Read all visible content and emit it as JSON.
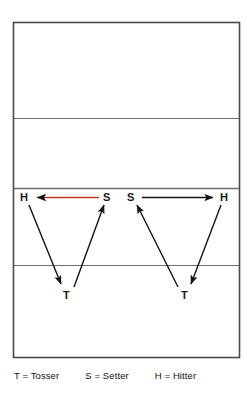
{
  "diagram": {
    "kind": "volleyball-court-drill",
    "colors": {
      "court_line": "#4a4a4a",
      "court_fill": "#ffffff",
      "arrow_black": "#141414",
      "arrow_red": "#c0392b",
      "text": "#1a1a1a"
    },
    "court": {
      "outline": {
        "x": 13,
        "y": 22,
        "width": 227,
        "height": 336
      },
      "lines": [
        {
          "name": "back-attack-line",
          "y": 118
        },
        {
          "name": "net-line",
          "y": 188
        },
        {
          "name": "front-attack-line",
          "y": 265
        }
      ]
    },
    "players": [
      {
        "id": "hitter-left",
        "label": "H",
        "x": 22,
        "y": 194
      },
      {
        "id": "setter-left",
        "label": "S",
        "x": 105,
        "y": 194
      },
      {
        "id": "setter-right",
        "label": "S",
        "x": 128,
        "y": 194
      },
      {
        "id": "hitter-right",
        "label": "H",
        "x": 222,
        "y": 194
      },
      {
        "id": "tosser-left",
        "label": "T",
        "x": 64,
        "y": 291
      },
      {
        "id": "tosser-right",
        "label": "T",
        "x": 182,
        "y": 291
      }
    ],
    "arrows": [
      {
        "id": "setter-to-hitter-left",
        "from": "setter-left",
        "to": "hitter-left",
        "color": "#c0392b",
        "head_color": "#141414"
      },
      {
        "id": "hitter-to-tosser-left",
        "from": "hitter-left",
        "to": "tosser-left",
        "color": "#141414",
        "head_color": "#141414"
      },
      {
        "id": "tosser-to-setter-left",
        "from": "tosser-left",
        "to": "setter-left",
        "color": "#141414",
        "head_color": "#141414"
      },
      {
        "id": "setter-to-hitter-right",
        "from": "setter-right",
        "to": "hitter-right",
        "color": "#141414",
        "head_color": "#141414"
      },
      {
        "id": "hitter-to-tosser-right",
        "from": "hitter-right",
        "to": "tosser-right",
        "color": "#141414",
        "head_color": "#141414"
      },
      {
        "id": "tosser-to-setter-right",
        "from": "tosser-right",
        "to": "setter-right",
        "color": "#141414",
        "head_color": "#141414"
      }
    ],
    "legend": {
      "tosser": "T = Tosser",
      "setter": "S = Setter",
      "hitter": "H = Hitter"
    }
  }
}
